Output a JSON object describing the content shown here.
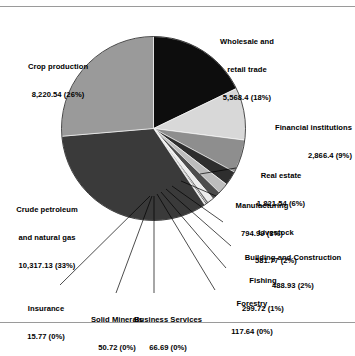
{
  "chart_data": {
    "type": "pie",
    "title": "",
    "subtitle": "",
    "xlabel": "",
    "ylabel": "",
    "legend_position": "none",
    "grid": false,
    "total": 31210.24,
    "categories": [
      "Wholesale and retail trade",
      "Financial institutions",
      "Real estate",
      "Manufacturing",
      "Livestock",
      "Building and Construction",
      "Fishing",
      "Forestry",
      "Business Services",
      "Solid Minerals",
      "Insurance",
      "Crude petroleum and natural gas",
      "Crop production"
    ],
    "values": [
      5568.4,
      2866.4,
      1821.54,
      794.99,
      581.77,
      488.93,
      299.72,
      117.64,
      66.69,
      50.72,
      15.77,
      10317.13,
      8220.54
    ],
    "percents": [
      18,
      9,
      6,
      3,
      2,
      2,
      1,
      0,
      0,
      0,
      0,
      33,
      26
    ],
    "slices": [
      {
        "name": "Wholesale and retail trade",
        "value": 5568.4,
        "value_text": "5,568.4",
        "percent_text": "(18%)",
        "color": "#0d0d0d",
        "start_deg": 0.0,
        "end_deg": 64.23
      },
      {
        "name": "Financial institutions",
        "value": 2866.4,
        "value_text": "2,866.4",
        "percent_text": "(9%)",
        "color": "#d8d8d8",
        "start_deg": 64.23,
        "end_deg": 97.29
      },
      {
        "name": "Real estate",
        "value": 1821.54,
        "value_text": "1,821.54",
        "percent_text": "(6%)",
        "color": "#8e8e8e",
        "start_deg": 97.29,
        "end_deg": 118.3
      },
      {
        "name": "Manufacturing",
        "value": 794.99,
        "value_text": "794.99",
        "percent_text": "(3%)",
        "color": "#2e2e2e",
        "start_deg": 118.3,
        "end_deg": 127.47
      },
      {
        "name": "Livestock",
        "value": 581.77,
        "value_text": "581.77",
        "percent_text": "(2%)",
        "color": "#bdbdbd",
        "start_deg": 127.47,
        "end_deg": 134.18
      },
      {
        "name": "Building and Construction",
        "value": 488.93,
        "value_text": "488.93",
        "percent_text": "(2%)",
        "color": "#4d4d4d",
        "start_deg": 134.18,
        "end_deg": 139.82
      },
      {
        "name": "Fishing",
        "value": 299.72,
        "value_text": "299.72",
        "percent_text": "(1%)",
        "color": "#ececec",
        "start_deg": 139.82,
        "end_deg": 143.27
      },
      {
        "name": "Forestry",
        "value": 117.64,
        "value_text": "117.64",
        "percent_text": "(0%)",
        "color": "#707070",
        "start_deg": 143.27,
        "end_deg": 144.63
      },
      {
        "name": "Business Services",
        "value": 66.69,
        "value_text": "66.69",
        "percent_text": "(0%)",
        "color": "#151515",
        "start_deg": 144.63,
        "end_deg": 145.4
      },
      {
        "name": "Solid Minerals",
        "value": 50.72,
        "value_text": "50.72",
        "percent_text": "(0%)",
        "color": "#cfcfcf",
        "start_deg": 145.4,
        "end_deg": 145.98
      },
      {
        "name": "Insurance",
        "value": 15.77,
        "value_text": "15.77",
        "percent_text": "(0%)",
        "color": "#5a5a5a",
        "start_deg": 145.98,
        "end_deg": 146.16
      },
      {
        "name": "Crude petroleum and natural gas",
        "value": 10317.13,
        "value_text": "10,317.13",
        "percent_text": "(33%)",
        "color": "#3a3a3a",
        "start_deg": 146.16,
        "end_deg": 265.16
      },
      {
        "name": "Crop production",
        "value": 8220.54,
        "value_text": "8,220.54",
        "percent_text": "(26%)",
        "color": "#9a9a9a",
        "start_deg": 265.16,
        "end_deg": 360.0
      }
    ]
  },
  "labels": {
    "wholesale": {
      "line1": "Wholesale and",
      "line2": "retail trade",
      "line3": "5,568.4 (18%)"
    },
    "financial": {
      "line1": "Financial institutions",
      "line2": "2,866.4 (9%)"
    },
    "real_estate": {
      "line1": "Real estate",
      "line2": "1,821.54 (6%)"
    },
    "manufacturing": {
      "line1": "Manufacturing",
      "line2": "794.99 (3%)"
    },
    "livestock": {
      "line1": "Livestock",
      "line2": "581.77 (2%)"
    },
    "building": {
      "line1": "Building and Construction",
      "line2": "488.93 (2%)"
    },
    "fishing": {
      "line1": "Fishing",
      "line2": "299.72 (1%)"
    },
    "forestry": {
      "line1": "Forestry",
      "line2": "117.64 (0%)"
    },
    "business_services": {
      "line1": "Business Services",
      "line2": "66.69 (0%)"
    },
    "solid_minerals": {
      "line1": "Solid Minerals",
      "line2": "50.72 (0%)"
    },
    "insurance": {
      "line1": "Insurance",
      "line2": "15.77 (0%)"
    },
    "crude": {
      "line1": "Crude petroleum",
      "line2": "and natural gas",
      "line3": "10,317.13 (33%)"
    },
    "crop": {
      "line1": "Crop production",
      "line2": "8,220.54 (26%)"
    }
  },
  "style": {
    "leader_color": "#000000",
    "rule_color": "#9a9a9a",
    "background": "#ffffff"
  }
}
